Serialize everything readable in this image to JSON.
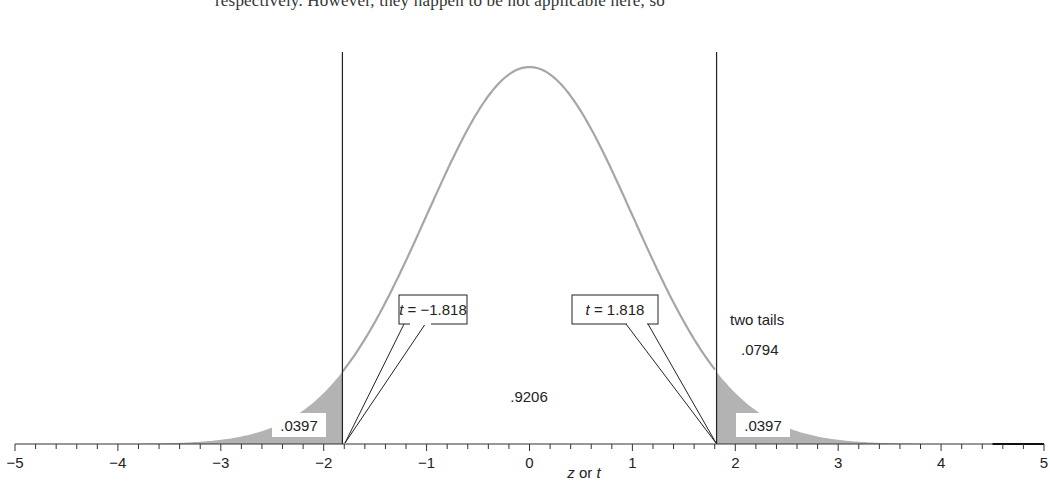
{
  "page": {
    "top_text": "respectively. However, they happen to be not applicable here, so"
  },
  "chart_data": {
    "type": "area",
    "title": "",
    "xlabel_parts": [
      "z",
      " or ",
      "t"
    ],
    "xlabel": "z or t",
    "ylabel": "",
    "xlim": [
      -5,
      5
    ],
    "x_ticks": [
      -5,
      -4,
      -3,
      -2,
      -1,
      0,
      1,
      2,
      3,
      4,
      5
    ],
    "x_tick_labels": [
      "−5",
      "−4",
      "−3",
      "−2",
      "−1",
      "0",
      "1",
      "2",
      "3",
      "4",
      "5"
    ],
    "minor_tick_step": 0.2,
    "grid": false,
    "curve": "standard normal density",
    "critical_values": [
      -1.818,
      1.818
    ],
    "shaded_regions": [
      {
        "from": -5,
        "to": -1.818,
        "area": 0.0397,
        "label": ".0397"
      },
      {
        "from": 1.818,
        "to": 5,
        "area": 0.0397,
        "label": ".0397"
      }
    ],
    "annotations": {
      "left_callout": {
        "italic": "t",
        "text": " = −1.818"
      },
      "right_callout": {
        "italic": "t",
        "text": " = 1.818"
      },
      "center_area": ".9206",
      "two_tails_label": "two tails",
      "two_tails_value": ".0794"
    },
    "colors": {
      "curve": "#a6a6a6",
      "shade": "#b3b3b3",
      "axis": "#333333",
      "lines": "#222222"
    }
  }
}
